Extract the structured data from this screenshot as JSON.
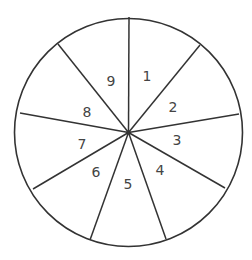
{
  "diagram": {
    "type": "spinner",
    "sector_count": 9,
    "center": [
      128.5,
      132.5
    ],
    "radius": 114,
    "stroke_color": "#333333",
    "label_color": "#444444",
    "background": "#ffffff",
    "spokes": [
      [
        129,
        17
      ],
      [
        200,
        45
      ],
      [
        239,
        114
      ],
      [
        225,
        188
      ],
      [
        166,
        239
      ],
      [
        90,
        240
      ],
      [
        33,
        189
      ],
      [
        20,
        113
      ],
      [
        58,
        44
      ]
    ],
    "sectors": [
      {
        "label": "1",
        "x": 147,
        "y": 81
      },
      {
        "label": "2",
        "x": 173,
        "y": 112
      },
      {
        "label": "3",
        "x": 177,
        "y": 145
      },
      {
        "label": "4",
        "x": 160,
        "y": 175
      },
      {
        "label": "5",
        "x": 128,
        "y": 189
      },
      {
        "label": "6",
        "x": 96,
        "y": 177
      },
      {
        "label": "7",
        "x": 82,
        "y": 149
      },
      {
        "label": "8",
        "x": 87,
        "y": 117
      },
      {
        "label": "9",
        "x": 111,
        "y": 86
      }
    ]
  }
}
